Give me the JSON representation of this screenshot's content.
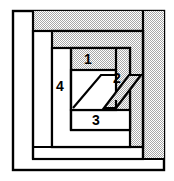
{
  "figure": {
    "canvas": {
      "width": 174,
      "height": 181
    },
    "colors": {
      "background": "#ffffff",
      "stroke": "#000000",
      "fill_white": "#ffffff",
      "fill_gray": "#cfcfcf",
      "fill_gray_light": "#d8d8d8",
      "label_text": "#000000"
    },
    "stroke_width": 2.2
  },
  "labels": [
    {
      "id": "label-1",
      "text": "1",
      "x": 88,
      "y": 62,
      "region": "top inner strip"
    },
    {
      "id": "label-2",
      "text": "2",
      "x": 116,
      "y": 81,
      "region": "right diagonal parallelogram"
    },
    {
      "id": "label-3",
      "text": "3",
      "x": 95,
      "y": 120,
      "region": "bottom inner strip"
    },
    {
      "id": "label-4",
      "text": "4",
      "x": 59,
      "y": 86,
      "region": "left inner strip"
    }
  ],
  "shapes": {
    "outer_frame": {
      "x": 13,
      "y": 11,
      "w": 151,
      "h": 159,
      "fill": "#ffffff"
    },
    "gray_top_band": {
      "x": 33,
      "y": 11,
      "w": 131,
      "h": 22,
      "fill": "#cfcfcf"
    },
    "gray_right_band": {
      "x": 143,
      "y": 11,
      "w": 21,
      "h": 148,
      "fill": "#cfcfcf"
    },
    "band_2": {
      "x": 33,
      "y": 31,
      "w": 111,
      "h": 116,
      "fill": "#cfcfcf"
    },
    "white_left_strip": {
      "x": 33,
      "y": 31,
      "w": 19,
      "h": 128,
      "fill": "#ffffff"
    },
    "band_3": {
      "x": 52,
      "y": 48,
      "w": 78,
      "h": 99,
      "fill": "#cfcfcf"
    },
    "white_strip_4": {
      "x": 52,
      "y": 48,
      "w": 19,
      "h": 82,
      "fill": "#ffffff"
    },
    "strip_1": {
      "x": 71,
      "y": 48,
      "w": 45,
      "h": 22,
      "fill": "#cfcfcf"
    },
    "inner_white": {
      "x": 71,
      "y": 70,
      "w": 45,
      "h": 40,
      "fill": "#ffffff"
    },
    "strip_3": {
      "x": 71,
      "y": 110,
      "w": 59,
      "h": 20,
      "fill": "#ffffff"
    },
    "bottom_white_1": {
      "x": 52,
      "y": 130,
      "w": 91,
      "h": 17,
      "fill": "#ffffff"
    },
    "bottom_white_2": {
      "x": 33,
      "y": 147,
      "w": 131,
      "h": 23,
      "fill": "#ffffff"
    },
    "parallelogram_left": {
      "points": "76,107 101,75 116,75 91,107",
      "fill": "#ffffff"
    },
    "parallelogram_right": {
      "points": "116,107 141,75 130,75 105,107",
      "fill": "#cfcfcf"
    }
  }
}
